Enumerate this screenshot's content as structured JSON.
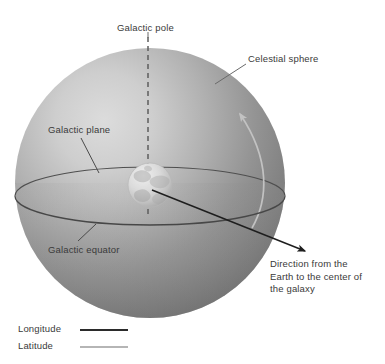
{
  "figure": {
    "background_color": "#ffffff",
    "text_color": "#3a3a3a"
  },
  "labels": {
    "galactic_pole": "Galactic pole",
    "celestial_sphere": "Celestial sphere",
    "galactic_plane": "Galactic plane",
    "galactic_equator": "Galactic equator",
    "direction_line1": "Direction from the",
    "direction_line2": "Earth to the center of",
    "direction_line3": "the galaxy"
  },
  "legend": {
    "items": [
      {
        "label": "Longitude",
        "color": "#2b2b2b",
        "style": "solid-dark"
      },
      {
        "label": "Latitude",
        "color": "#b5b5b5",
        "style": "solid-light"
      }
    ]
  },
  "elements": {
    "celestial_sphere": {
      "shape": "sphere",
      "center_x": 150,
      "center_y": 183,
      "radius": 135,
      "highlight_color": "#d2d2d2",
      "midtone_color": "#9a9a9a",
      "shadow_color": "#6e6e6e"
    },
    "galactic_plane": {
      "shape": "ellipse",
      "center_x": 150,
      "center_y": 196,
      "radius_x": 135,
      "radius_y": 29,
      "outline_color": "#4a4a4a"
    },
    "galactic_pole_axis": {
      "shape": "dashed-line",
      "color": "#5a5a5a",
      "dash": "5 4"
    },
    "earth": {
      "shape": "small-globe",
      "center_x": 150,
      "center_y": 185,
      "radius": 22,
      "color": "#d8d8d8"
    },
    "direction_arrow": {
      "shape": "arrow",
      "color": "#1e1e1e",
      "from_x": 152,
      "from_y": 190,
      "to_x": 307,
      "to_y": 252
    },
    "latitude_arc": {
      "shape": "curved-arrow",
      "color": "#c2c2c2"
    }
  }
}
